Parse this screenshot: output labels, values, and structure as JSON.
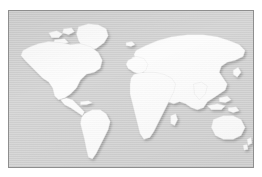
{
  "image": {
    "kind": "world-map",
    "title": "World Map",
    "projection": "equirectangular",
    "caption": "",
    "alt_text": "Grayscale world map with white landmasses on a light grey ocean"
  },
  "frame": {
    "border_color": "#8e8e8e",
    "page_background": "#ffffff",
    "ocean_color": "#d2d2d2",
    "land_color": "#fdfdfd",
    "land_outline_color": "#e3e3e3",
    "shadow_color": "#9a9a9a"
  },
  "regions": [
    {
      "name": "north-america",
      "label": "North America"
    },
    {
      "name": "greenland",
      "label": "Greenland"
    },
    {
      "name": "south-america",
      "label": "South America"
    },
    {
      "name": "europe",
      "label": "Europe"
    },
    {
      "name": "africa",
      "label": "Africa"
    },
    {
      "name": "asia",
      "label": "Asia"
    },
    {
      "name": "australia",
      "label": "Australia"
    },
    {
      "name": "southeast-asia-islands",
      "label": "Southeast Asia Islands"
    },
    {
      "name": "new-zealand",
      "label": "New Zealand"
    },
    {
      "name": "japan",
      "label": "Japan"
    },
    {
      "name": "british-isles",
      "label": "British Isles"
    },
    {
      "name": "madagascar",
      "label": "Madagascar"
    },
    {
      "name": "iceland",
      "label": "Iceland"
    },
    {
      "name": "arctic-islands",
      "label": "Arctic Islands"
    }
  ]
}
